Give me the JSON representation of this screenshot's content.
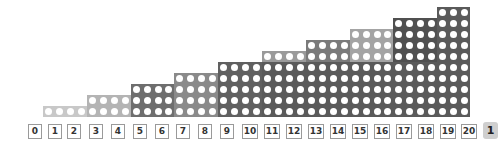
{
  "diagram": {
    "title": "",
    "grid": {
      "origin_x": 43,
      "bottom_y": 106,
      "cell_size": 11,
      "pitch_x": 10.95,
      "steps": [
        {
          "cols": 4,
          "rows": 1,
          "shade": "#c8c8c8"
        },
        {
          "cols": 4,
          "rows": 2,
          "shade": "#b4b4b4"
        },
        {
          "cols": 4,
          "rows": 3,
          "shade": "#6e6e6e"
        },
        {
          "cols": 4,
          "rows": 4,
          "shade": "#8a8a8a"
        },
        {
          "cols": 4,
          "rows": 5,
          "shade": "#606060"
        },
        {
          "cols": 4,
          "rows": 6,
          "shade": "#9a9a9a"
        },
        {
          "cols": 4,
          "rows": 7,
          "shade": "#7a7a7a"
        },
        {
          "cols": 4,
          "rows": 8,
          "shade": "#a4a4a4"
        },
        {
          "cols": 4,
          "rows": 9,
          "shade": "#505050"
        },
        {
          "cols": 3,
          "rows": 10,
          "shade": "#5a5a5a"
        }
      ],
      "base_shade": "#5a5a5a"
    },
    "number_line": {
      "labels": [
        "0",
        "1",
        "2",
        "3",
        "4",
        "5",
        "6",
        "7",
        "8",
        "9",
        "10",
        "11",
        "12",
        "13",
        "14",
        "15",
        "16",
        "17",
        "18",
        "19",
        "20"
      ],
      "positions_x": [
        28,
        48,
        67,
        89,
        111,
        133,
        155,
        176,
        198,
        220,
        242,
        264,
        286,
        308,
        330,
        352,
        374,
        396,
        418,
        440,
        461
      ],
      "box_width": 14
    },
    "page_badge": "1"
  }
}
